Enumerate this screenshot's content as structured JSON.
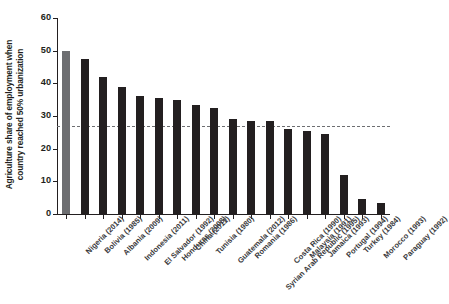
{
  "chart_data": {
    "type": "bar",
    "title": "",
    "xlabel": "",
    "ylabel": "Agriculture share of employment when country reached 50% urbanization",
    "ylabel_lines": [
      "Agriculture share of employment when",
      "country reached 50% urbanization"
    ],
    "ylim": [
      0,
      60
    ],
    "yticks": [
      0,
      10,
      20,
      30,
      40,
      50,
      60
    ],
    "ytick_labels": [
      "0",
      "10",
      "20",
      "30",
      "40",
      "50",
      "60"
    ],
    "grid": false,
    "legend": null,
    "categories": [
      "Nigeria (2014)",
      "Bolivia (1985)",
      "Albania (2009)",
      "Indonesia (2011)",
      "El Salvador (1992)",
      "Honduras (2008)",
      "China (2011)",
      "Tunisia (1980)",
      "Guatemala (2012)",
      "Romania (1986)",
      "Syrian Arab Republic (1995)",
      "Costa Rica (1990)",
      "Malaysia (1991)",
      "Jamaica (1993)",
      "Portugal (1994)",
      "Turkey (1984)",
      "Morocco (1993)",
      "Paraguay (1992)"
    ],
    "values": [
      50,
      47.5,
      42,
      39,
      36,
      35.5,
      35,
      33.5,
      32.5,
      29,
      28.5,
      28.5,
      26,
      25.5,
      24.5,
      12,
      4.5,
      3.5
    ],
    "highlight_index": 0,
    "annotations": [
      {
        "type": "reference-line",
        "style": "dashed",
        "orientation": "horizontal",
        "value": 26.5,
        "color": "#6d6e71"
      }
    ],
    "colors": {
      "bar": "#231f20",
      "bar_highlight": "#6d6e71",
      "axis": "#231f20",
      "refline": "#6d6e71",
      "background": "#ffffff"
    }
  }
}
